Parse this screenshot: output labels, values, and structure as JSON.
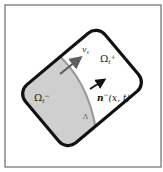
{
  "diagram": {
    "labels": {
      "omega_plus": "Ω",
      "omega_plus_sub": "t",
      "omega_plus_sup": "+",
      "omega_minus": "Ω",
      "omega_minus_sub": "t",
      "omega_minus_sup": "−",
      "velocity": "v",
      "velocity_sub": "s",
      "normal": "n",
      "normal_sup": "−",
      "normal_args": "(x, t)",
      "interface": "Λ"
    },
    "colors": {
      "frame_border": "#6b6b6b",
      "domain_border": "#111111",
      "region_minus_fill": "#cfcfcf",
      "region_plus_fill": "#ffffff",
      "interface_line": "#9a9a9a",
      "arrow": "#5f5f5f",
      "normal_arrow": "#111111"
    }
  }
}
